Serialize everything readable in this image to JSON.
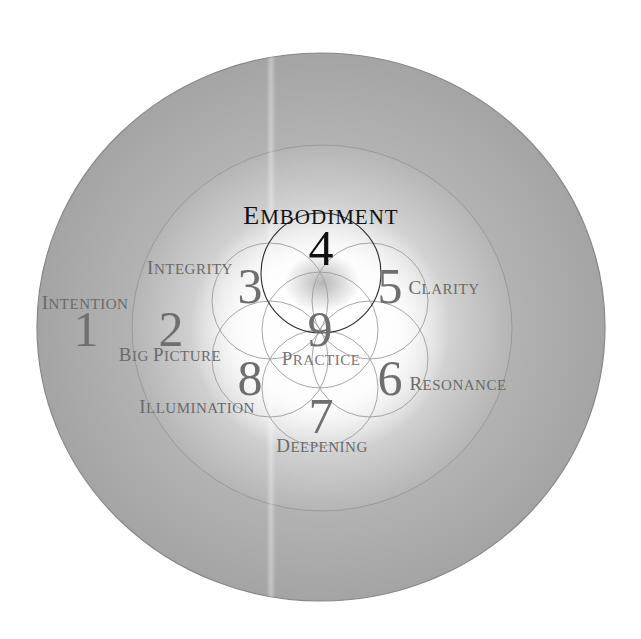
{
  "colors": {
    "outer_ring": "#a9a9a9",
    "middle_ring": "#b4b4b4",
    "center_glow": "#ffffff",
    "highlight_text": "#111111",
    "muted_text": "#6f6f6f"
  },
  "stages": [
    {
      "number": "1",
      "label": "Intention",
      "label_cap": "I",
      "label_rest": "NTENTION",
      "ring": "outer"
    },
    {
      "number": "2",
      "label": "Big Picture",
      "label_cap": "B",
      "label_rest": "IG ",
      "label_cap2": "P",
      "label_rest2": "ICTURE",
      "ring": "middle"
    },
    {
      "number": "3",
      "label": "Integrity",
      "label_cap": "I",
      "label_rest": "NTEGRITY",
      "ring": "petal"
    },
    {
      "number": "4",
      "label": "Embodiment",
      "label_cap": "E",
      "label_rest": "MBODIMENT",
      "ring": "petal",
      "highlighted": true
    },
    {
      "number": "5",
      "label": "Clarity",
      "label_cap": "C",
      "label_rest": "LARITY",
      "ring": "petal"
    },
    {
      "number": "6",
      "label": "Resonance",
      "label_cap": "R",
      "label_rest": "ESONANCE",
      "ring": "petal"
    },
    {
      "number": "7",
      "label": "Deepening",
      "label_cap": "D",
      "label_rest": "EEPENING",
      "ring": "petal"
    },
    {
      "number": "8",
      "label": "Illumination",
      "label_cap": "I",
      "label_rest": "LLUMINATION",
      "ring": "petal"
    },
    {
      "number": "9",
      "label": "Practice",
      "label_cap": "P",
      "label_rest": "RACTICE",
      "ring": "center"
    }
  ]
}
